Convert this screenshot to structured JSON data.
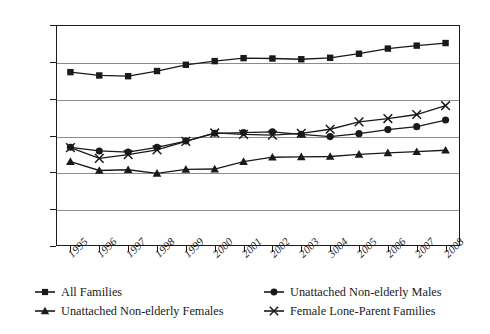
{
  "chart_data": {
    "type": "line",
    "title": "",
    "xlabel": "",
    "ylabel": "",
    "grid": true,
    "legend_position": "bottom",
    "ylim": [
      0,
      60000
    ],
    "ytick_labels": [
      "60,000",
      "50,000",
      "40,000",
      "30,000",
      "20,000",
      "10,000",
      "0"
    ],
    "ytick_values": [
      60000,
      50000,
      40000,
      30000,
      20000,
      10000,
      0
    ],
    "categories": [
      "1995",
      "1996",
      "1997",
      "1998",
      "1999",
      "2000",
      "2001",
      "2002",
      "2003",
      "3004",
      "2005",
      "2006",
      "2007",
      "2008"
    ],
    "x": [
      1995,
      1996,
      1997,
      1998,
      1999,
      2000,
      2001,
      2002,
      2003,
      2004,
      2005,
      2006,
      2007,
      2008
    ],
    "series": [
      {
        "name": "All Families",
        "marker": "square",
        "values": [
          47200,
          46300,
          46100,
          47500,
          49200,
          50200,
          51000,
          50900,
          50700,
          51100,
          52200,
          53600,
          54400,
          55100
        ]
      },
      {
        "name": "Unattached Non-elderly Males",
        "marker": "circle",
        "values": [
          26800,
          25800,
          25500,
          26800,
          28500,
          30600,
          30800,
          31000,
          30300,
          29700,
          30500,
          31600,
          32400,
          34200
        ]
      },
      {
        "name": "Unattached Non-elderly Females",
        "marker": "triangle",
        "values": [
          22900,
          20500,
          20700,
          19700,
          20800,
          20900,
          22900,
          24100,
          24200,
          24300,
          24900,
          25300,
          25600,
          26000
        ]
      },
      {
        "name": "Female Lone-Parent Families",
        "marker": "x",
        "values": [
          26700,
          23800,
          24800,
          26100,
          28400,
          30700,
          30300,
          30100,
          30600,
          31700,
          33700,
          34600,
          35700,
          38100
        ]
      }
    ]
  },
  "legend": {
    "items": [
      {
        "label": "All Families",
        "marker": "square"
      },
      {
        "label": "Unattached Non-elderly Males",
        "marker": "circle"
      },
      {
        "label": "Unattached Non-elderly Females",
        "marker": "triangle"
      },
      {
        "label": "Female Lone-Parent Families",
        "marker": "x"
      }
    ]
  },
  "colors": {
    "ink": "#1a1a1a",
    "grid": "#8c8c8c",
    "background": "#ffffff"
  }
}
